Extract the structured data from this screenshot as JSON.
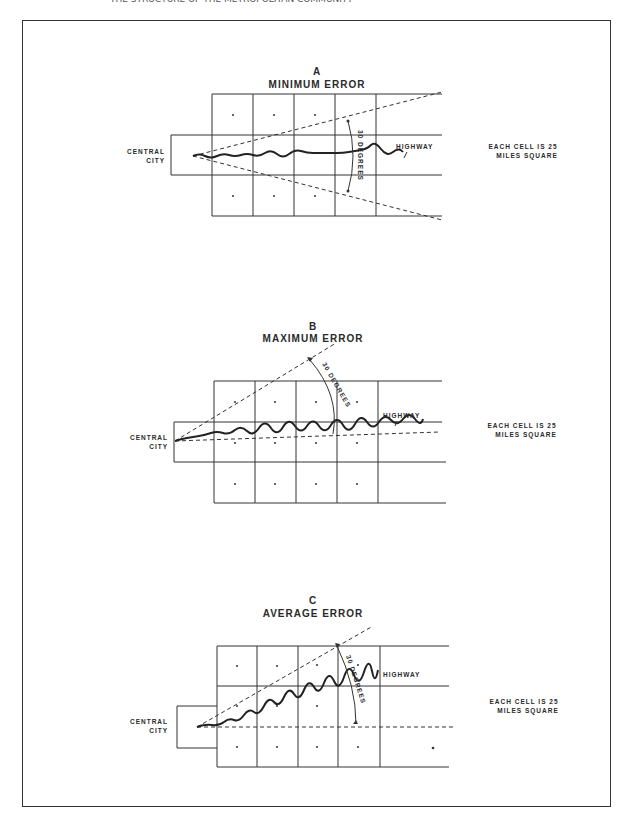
{
  "figure": {
    "header_partial": "THE STRUCTURE OF THE METROPOLITAN COMMUNITY",
    "panels": [
      {
        "id": "A",
        "letter": "A",
        "title": "MINIMUM ERROR",
        "origin_label_line1": "CENTRAL",
        "origin_label_line2": "CITY",
        "highway_label": "HIGHWAY",
        "angle_label": "30 DEGREES",
        "note_line1": "EACH CELL IS 25",
        "note_line2": "MILES SQUARE"
      },
      {
        "id": "B",
        "letter": "B",
        "title": "MAXIMUM ERROR",
        "origin_label_line1": "CENTRAL",
        "origin_label_line2": "CITY",
        "highway_label": "HIGHWAY",
        "angle_label": "30 DEGREES",
        "note_line1": "EACH CELL IS 25",
        "note_line2": "MILES SQUARE"
      },
      {
        "id": "C",
        "letter": "C",
        "title": "AVERAGE ERROR",
        "origin_label_line1": "CENTRAL",
        "origin_label_line2": "CITY",
        "highway_label": "HIGHWAY",
        "angle_label": "30 DEGREES",
        "note_line1": "EACH CELL IS 25",
        "note_line2": "MILES SQUARE"
      }
    ]
  }
}
